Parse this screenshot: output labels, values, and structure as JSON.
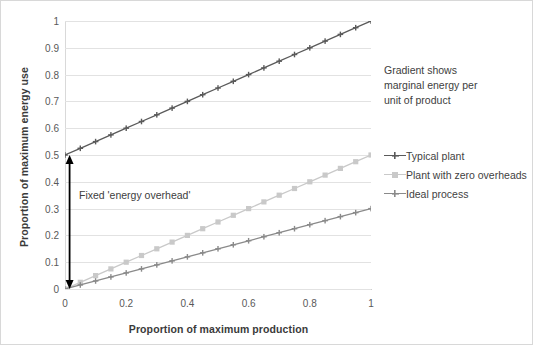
{
  "chart_data": {
    "type": "line",
    "title": "",
    "xlabel": "Proportion of maximum production",
    "ylabel": "Proportion of maximum energy use",
    "xlim": [
      0,
      1
    ],
    "ylim": [
      0,
      1
    ],
    "grid": "horizontal",
    "legend_position": "right",
    "x": [
      0,
      0.05,
      0.1,
      0.15,
      0.2,
      0.25,
      0.3,
      0.35,
      0.4,
      0.45,
      0.5,
      0.55,
      0.6,
      0.65,
      0.7,
      0.75,
      0.8,
      0.85,
      0.9,
      0.95,
      1
    ],
    "series": [
      {
        "name": "Typical plant",
        "color": "#5a5a5a",
        "marker": "plus",
        "values": [
          0.5,
          0.525,
          0.55,
          0.575,
          0.6,
          0.625,
          0.65,
          0.675,
          0.7,
          0.725,
          0.75,
          0.775,
          0.8,
          0.825,
          0.85,
          0.875,
          0.9,
          0.925,
          0.95,
          0.975,
          1.0
        ]
      },
      {
        "name": "Plant with zero overheads",
        "color": "#c9c9c9",
        "marker": "square",
        "values": [
          0,
          0.025,
          0.05,
          0.075,
          0.1,
          0.125,
          0.15,
          0.175,
          0.2,
          0.225,
          0.25,
          0.275,
          0.3,
          0.325,
          0.35,
          0.375,
          0.4,
          0.425,
          0.45,
          0.475,
          0.5
        ]
      },
      {
        "name": "Ideal process",
        "color": "#8a8a8a",
        "marker": "plus",
        "values": [
          0,
          0.015,
          0.03,
          0.045,
          0.06,
          0.075,
          0.09,
          0.105,
          0.12,
          0.135,
          0.15,
          0.165,
          0.18,
          0.195,
          0.21,
          0.225,
          0.24,
          0.255,
          0.27,
          0.285,
          0.3
        ]
      }
    ],
    "xticks": [
      "0",
      "0.2",
      "0.4",
      "0.6",
      "0.8",
      "1"
    ],
    "xtick_values": [
      0,
      0.2,
      0.4,
      0.6,
      0.8,
      1
    ],
    "yticks": [
      "0",
      "0.1",
      "0.2",
      "0.3",
      "0.4",
      "0.5",
      "0.6",
      "0.7",
      "0.8",
      "0.9",
      "1"
    ],
    "ytick_values": [
      0,
      0.1,
      0.2,
      0.3,
      0.4,
      0.5,
      0.6,
      0.7,
      0.8,
      0.9,
      1
    ],
    "annotations": [
      {
        "name": "fixed-energy-overhead",
        "text": "Fixed 'energy overhead'",
        "type": "double-arrow",
        "x": 0.015,
        "y_from": 0,
        "y_to": 0.5,
        "color": "#000000"
      },
      {
        "name": "gradient-note",
        "text": "Gradient shows marginal energy per unit of product",
        "lines": [
          "Gradient shows",
          "marginal energy per",
          "unit of product"
        ],
        "type": "text"
      }
    ]
  },
  "legend": {
    "items": [
      {
        "label": "Typical plant",
        "color": "#5a5a5a",
        "marker": "plus"
      },
      {
        "label": "Plant with zero overheads",
        "color": "#c9c9c9",
        "marker": "square"
      },
      {
        "label": "Ideal process",
        "color": "#8a8a8a",
        "marker": "plus"
      }
    ]
  },
  "colors": {
    "background": "#ffffff",
    "gridline": "#e2e2e2",
    "axis": "#d4d4d4",
    "text": "#3a3a3a",
    "tick_text": "#595959"
  }
}
